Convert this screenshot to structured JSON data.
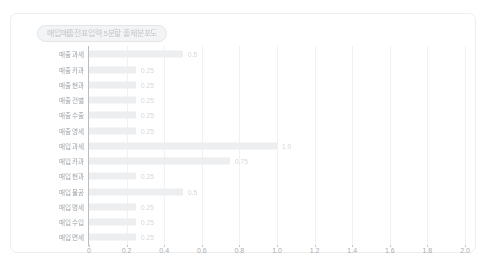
{
  "card": {
    "title": "매입매출전표입력 5분할 출제분포도"
  },
  "chart_data": {
    "type": "bar",
    "orientation": "horizontal",
    "title": "매입매출전표입력 5분할 출제분포도",
    "xlabel": "",
    "ylabel": "",
    "xlim": [
      0,
      2.0
    ],
    "grid": true,
    "legend": "none",
    "xticks": [
      "0",
      "0.2",
      "0.4",
      "0.6",
      "0.8",
      "1.0",
      "1.2",
      "1.4",
      "1.6",
      "1.8",
      "2.0"
    ],
    "xtick_values": [
      0,
      0.2,
      0.4,
      0.6,
      0.8,
      1.0,
      1.2,
      1.4,
      1.6,
      1.8,
      2.0
    ],
    "categories": [
      "매출 과세",
      "매출 카과",
      "매출 현과",
      "매출 건별",
      "매출 수출",
      "매출 영세",
      "매입 과세",
      "매입 카과",
      "매입 현과",
      "매입 불공",
      "매입 명세",
      "매입 수입",
      "매입 면세"
    ],
    "values": [
      0.5,
      0.25,
      0.25,
      0.25,
      0.25,
      0.25,
      1.0,
      0.75,
      0.25,
      0.5,
      0.25,
      0.25,
      0.25
    ],
    "value_labels": [
      "0.5",
      "0.25",
      "0.25",
      "0.25",
      "0.25",
      "0.25",
      "1.0",
      "0.75",
      "0.25",
      "0.5",
      "0.25",
      "0.25",
      "0.25"
    ],
    "bar_color": "#eceeef",
    "label_color": "#9ea3a8",
    "value_color": "#d2d5d8",
    "axis_color": "#b9bcc0",
    "grid_color": "#f0f1f2"
  }
}
